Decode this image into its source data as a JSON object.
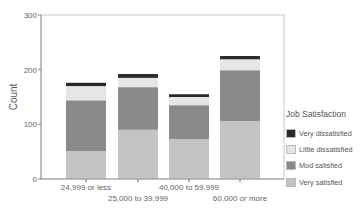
{
  "chart_data": {
    "type": "bar",
    "stacked": true,
    "title": "",
    "xlabel": "",
    "ylabel": "Count",
    "ylim": [
      0,
      300
    ],
    "yticks": [
      0,
      100,
      200,
      300
    ],
    "grid": false,
    "legend_position": "right",
    "legend_title": "Job Satisfaction",
    "categories": [
      "24,999 or less",
      "25,000 to 39,999",
      "40,000 to 59,999",
      "60,000 or more"
    ],
    "series": [
      {
        "name": "Very satisfied",
        "color": "#c4c4c4",
        "values": [
          51,
          90,
          73,
          106
        ]
      },
      {
        "name": "Mod satisfied",
        "color": "#8a8a8a",
        "values": [
          93,
          78,
          62,
          93
        ]
      },
      {
        "name": "Little dissatisfied",
        "color": "#e6e6e6",
        "values": [
          26,
          17,
          15,
          20
        ]
      },
      {
        "name": "Very dissatisfied",
        "color": "#2a2a2a",
        "values": [
          6,
          7,
          5,
          6
        ]
      }
    ],
    "legend_order": [
      "Very dissatisfied",
      "Little dissatisfied",
      "Mod satisfied",
      "Very satisfied"
    ]
  }
}
